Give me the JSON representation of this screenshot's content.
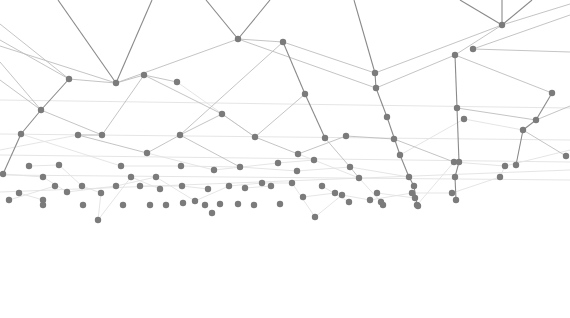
{
  "canvas": {
    "width": 570,
    "height": 318,
    "background": "#ffffff"
  },
  "style": {
    "node_color": "#7b7b7b",
    "node_radius": 3.2,
    "edge_dark": "#8a8a8a",
    "edge_mid": "#bdbdbd",
    "edge_light": "#e2e2e2"
  },
  "nodes": [
    {
      "id": "a1",
      "x": 116,
      "y": 83
    },
    {
      "id": "a2",
      "x": 69,
      "y": 79
    },
    {
      "id": "a3",
      "x": 144,
      "y": 75
    },
    {
      "id": "a4",
      "x": 177,
      "y": 82
    },
    {
      "id": "a5",
      "x": 238,
      "y": 39
    },
    {
      "id": "a6",
      "x": 283,
      "y": 42
    },
    {
      "id": "a7",
      "x": 375,
      "y": 73
    },
    {
      "id": "a8",
      "x": 376,
      "y": 88
    },
    {
      "id": "a9",
      "x": 502,
      "y": 25
    },
    {
      "id": "a10",
      "x": 473,
      "y": 49
    },
    {
      "id": "a11",
      "x": 455,
      "y": 55
    },
    {
      "id": "a12",
      "x": 41,
      "y": 110
    },
    {
      "id": "a13",
      "x": 305,
      "y": 94
    },
    {
      "id": "a14",
      "x": 222,
      "y": 114
    },
    {
      "id": "a15",
      "x": 552,
      "y": 93
    },
    {
      "id": "a16",
      "x": 387,
      "y": 117
    },
    {
      "id": "b1",
      "x": 21,
      "y": 134
    },
    {
      "id": "b2",
      "x": 78,
      "y": 135
    },
    {
      "id": "b3",
      "x": 102,
      "y": 135
    },
    {
      "id": "b4",
      "x": 180,
      "y": 135
    },
    {
      "id": "b5",
      "x": 255,
      "y": 137
    },
    {
      "id": "b6",
      "x": 325,
      "y": 138
    },
    {
      "id": "b7",
      "x": 346,
      "y": 136
    },
    {
      "id": "b8",
      "x": 394,
      "y": 139
    },
    {
      "id": "b9",
      "x": 147,
      "y": 153
    },
    {
      "id": "b10",
      "x": 298,
      "y": 154
    },
    {
      "id": "b11",
      "x": 400,
      "y": 155
    },
    {
      "id": "b12",
      "x": 457,
      "y": 108
    },
    {
      "id": "b13",
      "x": 464,
      "y": 119
    },
    {
      "id": "b14",
      "x": 523,
      "y": 130
    },
    {
      "id": "b15",
      "x": 536,
      "y": 120
    },
    {
      "id": "b16",
      "x": 566,
      "y": 156
    },
    {
      "id": "c1",
      "x": 3,
      "y": 174
    },
    {
      "id": "c2",
      "x": 29,
      "y": 166
    },
    {
      "id": "c3",
      "x": 59,
      "y": 165
    },
    {
      "id": "c4",
      "x": 43,
      "y": 177
    },
    {
      "id": "c5",
      "x": 121,
      "y": 166
    },
    {
      "id": "c6",
      "x": 181,
      "y": 166
    },
    {
      "id": "c7",
      "x": 214,
      "y": 170
    },
    {
      "id": "c8",
      "x": 240,
      "y": 167
    },
    {
      "id": "c9",
      "x": 278,
      "y": 163
    },
    {
      "id": "c10",
      "x": 297,
      "y": 171
    },
    {
      "id": "c11",
      "x": 314,
      "y": 160
    },
    {
      "id": "c12",
      "x": 350,
      "y": 167
    },
    {
      "id": "c13",
      "x": 359,
      "y": 178
    },
    {
      "id": "c14",
      "x": 409,
      "y": 177
    },
    {
      "id": "c15",
      "x": 414,
      "y": 186
    },
    {
      "id": "c16",
      "x": 454,
      "y": 162
    },
    {
      "id": "c17",
      "x": 459,
      "y": 162
    },
    {
      "id": "c18",
      "x": 505,
      "y": 166
    },
    {
      "id": "c19",
      "x": 516,
      "y": 165
    },
    {
      "id": "c20",
      "x": 455,
      "y": 177
    },
    {
      "id": "d1",
      "x": 19,
      "y": 193
    },
    {
      "id": "d2",
      "x": 9,
      "y": 200
    },
    {
      "id": "d3",
      "x": 43,
      "y": 200
    },
    {
      "id": "d4",
      "x": 55,
      "y": 186
    },
    {
      "id": "d5",
      "x": 67,
      "y": 192
    },
    {
      "id": "d6",
      "x": 82,
      "y": 186
    },
    {
      "id": "d7",
      "x": 101,
      "y": 193
    },
    {
      "id": "d8",
      "x": 116,
      "y": 186
    },
    {
      "id": "d9",
      "x": 131,
      "y": 177
    },
    {
      "id": "d10",
      "x": 140,
      "y": 186
    },
    {
      "id": "d11",
      "x": 156,
      "y": 177
    },
    {
      "id": "d12",
      "x": 160,
      "y": 189
    },
    {
      "id": "d13",
      "x": 182,
      "y": 186
    },
    {
      "id": "d14",
      "x": 195,
      "y": 201
    },
    {
      "id": "d15",
      "x": 208,
      "y": 189
    },
    {
      "id": "d16",
      "x": 229,
      "y": 186
    },
    {
      "id": "d17",
      "x": 245,
      "y": 188
    },
    {
      "id": "d18",
      "x": 262,
      "y": 183
    },
    {
      "id": "d19",
      "x": 271,
      "y": 186
    },
    {
      "id": "d20",
      "x": 292,
      "y": 183
    },
    {
      "id": "d21",
      "x": 303,
      "y": 197
    },
    {
      "id": "d22",
      "x": 322,
      "y": 186
    },
    {
      "id": "d23",
      "x": 335,
      "y": 193
    },
    {
      "id": "d24",
      "x": 342,
      "y": 195
    },
    {
      "id": "d25",
      "x": 349,
      "y": 202
    },
    {
      "id": "d26",
      "x": 370,
      "y": 200
    },
    {
      "id": "d27",
      "x": 377,
      "y": 193
    },
    {
      "id": "d28",
      "x": 381,
      "y": 202
    },
    {
      "id": "d29",
      "x": 412,
      "y": 193
    },
    {
      "id": "d30",
      "x": 415,
      "y": 198
    },
    {
      "id": "d31",
      "x": 417,
      "y": 205
    },
    {
      "id": "d32",
      "x": 452,
      "y": 193
    },
    {
      "id": "d33",
      "x": 456,
      "y": 200
    },
    {
      "id": "d34",
      "x": 500,
      "y": 177
    },
    {
      "id": "e1",
      "x": 43,
      "y": 205
    },
    {
      "id": "e2",
      "x": 83,
      "y": 205
    },
    {
      "id": "e3",
      "x": 123,
      "y": 205
    },
    {
      "id": "e4",
      "x": 150,
      "y": 205
    },
    {
      "id": "e5",
      "x": 166,
      "y": 205
    },
    {
      "id": "e6",
      "x": 183,
      "y": 203
    },
    {
      "id": "e7",
      "x": 205,
      "y": 205
    },
    {
      "id": "e8",
      "x": 220,
      "y": 204
    },
    {
      "id": "e9",
      "x": 238,
      "y": 204
    },
    {
      "id": "e10",
      "x": 98,
      "y": 220
    },
    {
      "id": "e11",
      "x": 212,
      "y": 213
    },
    {
      "id": "e12",
      "x": 315,
      "y": 217
    },
    {
      "id": "e13",
      "x": 254,
      "y": 205
    },
    {
      "id": "e14",
      "x": 280,
      "y": 204
    },
    {
      "id": "e15",
      "x": 383,
      "y": 205
    },
    {
      "id": "e16",
      "x": 418,
      "y": 206
    }
  ],
  "edges_dark": [
    [
      58,
      0,
      116,
      83
    ],
    [
      152,
      0,
      116,
      83
    ],
    [
      206,
      0,
      238,
      39
    ],
    [
      270,
      0,
      238,
      39
    ],
    [
      354,
      0,
      375,
      73
    ],
    [
      460,
      0,
      502,
      25
    ],
    [
      502,
      0,
      502,
      25
    ],
    [
      532,
      0,
      502,
      25
    ],
    [
      375,
      73,
      376,
      88
    ],
    [
      376,
      88,
      387,
      117
    ],
    [
      387,
      117,
      400,
      155
    ],
    [
      400,
      155,
      409,
      177
    ],
    [
      409,
      177,
      414,
      186
    ],
    [
      414,
      186,
      417,
      205
    ],
    [
      455,
      55,
      457,
      108
    ],
    [
      457,
      108,
      459,
      162
    ],
    [
      459,
      162,
      455,
      177
    ],
    [
      455,
      177,
      456,
      200
    ],
    [
      552,
      93,
      536,
      120
    ],
    [
      536,
      120,
      523,
      130
    ],
    [
      523,
      130,
      516,
      165
    ],
    [
      283,
      42,
      305,
      94
    ],
    [
      305,
      94,
      325,
      138
    ],
    [
      69,
      79,
      41,
      110
    ],
    [
      41,
      110,
      21,
      134
    ],
    [
      21,
      134,
      3,
      174
    ]
  ],
  "edges_mid": [
    [
      116,
      83,
      144,
      75
    ],
    [
      144,
      75,
      177,
      82
    ],
    [
      116,
      83,
      69,
      79
    ],
    [
      116,
      83,
      238,
      39
    ],
    [
      238,
      39,
      283,
      42
    ],
    [
      283,
      42,
      375,
      73
    ],
    [
      238,
      39,
      376,
      88
    ],
    [
      502,
      25,
      455,
      55
    ],
    [
      502,
      25,
      375,
      73
    ],
    [
      502,
      25,
      570,
      4
    ],
    [
      473,
      49,
      570,
      15
    ],
    [
      455,
      55,
      376,
      88
    ],
    [
      455,
      55,
      552,
      93
    ],
    [
      473,
      49,
      570,
      52
    ],
    [
      144,
      75,
      102,
      135
    ],
    [
      144,
      75,
      222,
      114
    ],
    [
      222,
      114,
      180,
      135
    ],
    [
      222,
      114,
      255,
      137
    ],
    [
      283,
      42,
      180,
      135
    ],
    [
      305,
      94,
      255,
      137
    ],
    [
      69,
      79,
      0,
      40
    ],
    [
      69,
      79,
      0,
      24
    ],
    [
      41,
      110,
      0,
      80
    ],
    [
      102,
      135,
      78,
      135
    ],
    [
      78,
      135,
      147,
      153
    ],
    [
      147,
      153,
      180,
      135
    ],
    [
      180,
      135,
      240,
      167
    ],
    [
      255,
      137,
      298,
      154
    ],
    [
      298,
      154,
      346,
      136
    ],
    [
      346,
      136,
      394,
      139
    ],
    [
      325,
      138,
      350,
      167
    ],
    [
      350,
      167,
      359,
      178
    ],
    [
      394,
      139,
      454,
      162
    ],
    [
      0,
      46,
      116,
      83
    ],
    [
      0,
      62,
      41,
      110
    ],
    [
      41,
      110,
      102,
      135
    ],
    [
      457,
      108,
      536,
      120
    ],
    [
      523,
      130,
      566,
      156
    ],
    [
      536,
      120,
      570,
      106
    ]
  ],
  "edges_light": [
    [
      0,
      100,
      570,
      108
    ],
    [
      0,
      134,
      570,
      140
    ],
    [
      0,
      155,
      570,
      162
    ],
    [
      0,
      175,
      570,
      180
    ],
    [
      0,
      192,
      570,
      170
    ],
    [
      21,
      134,
      121,
      166
    ],
    [
      121,
      166,
      181,
      166
    ],
    [
      181,
      166,
      240,
      167
    ],
    [
      240,
      167,
      297,
      171
    ],
    [
      297,
      171,
      350,
      167
    ],
    [
      350,
      167,
      409,
      177
    ],
    [
      29,
      166,
      59,
      165
    ],
    [
      59,
      165,
      82,
      186
    ],
    [
      82,
      186,
      101,
      193
    ],
    [
      101,
      193,
      98,
      220
    ],
    [
      98,
      220,
      131,
      177
    ],
    [
      131,
      177,
      160,
      189
    ],
    [
      3,
      174,
      43,
      177
    ],
    [
      43,
      177,
      67,
      192
    ],
    [
      67,
      192,
      116,
      186
    ],
    [
      116,
      186,
      156,
      177
    ],
    [
      156,
      177,
      195,
      201
    ],
    [
      195,
      201,
      229,
      186
    ],
    [
      229,
      186,
      262,
      183
    ],
    [
      262,
      183,
      292,
      183
    ],
    [
      292,
      183,
      315,
      217
    ],
    [
      315,
      217,
      342,
      195
    ],
    [
      342,
      195,
      370,
      200
    ],
    [
      370,
      200,
      412,
      193
    ],
    [
      412,
      193,
      452,
      193
    ],
    [
      452,
      193,
      500,
      177
    ],
    [
      500,
      177,
      505,
      166
    ],
    [
      505,
      166,
      570,
      150
    ],
    [
      214,
      170,
      278,
      163
    ],
    [
      278,
      163,
      314,
      160
    ],
    [
      314,
      160,
      359,
      178
    ],
    [
      359,
      178,
      381,
      202
    ],
    [
      417,
      205,
      454,
      162
    ],
    [
      454,
      162,
      505,
      166
    ],
    [
      19,
      193,
      43,
      200
    ],
    [
      9,
      200,
      55,
      186
    ],
    [
      140,
      186,
      182,
      186
    ],
    [
      182,
      186,
      208,
      189
    ],
    [
      245,
      188,
      271,
      186
    ],
    [
      303,
      197,
      335,
      193
    ],
    [
      322,
      186,
      349,
      202
    ],
    [
      377,
      193,
      415,
      198
    ],
    [
      400,
      155,
      464,
      119
    ],
    [
      464,
      119,
      523,
      130
    ],
    [
      177,
      82,
      255,
      137
    ],
    [
      0,
      150,
      78,
      135
    ],
    [
      147,
      153,
      214,
      170
    ],
    [
      298,
      154,
      314,
      160
    ]
  ]
}
